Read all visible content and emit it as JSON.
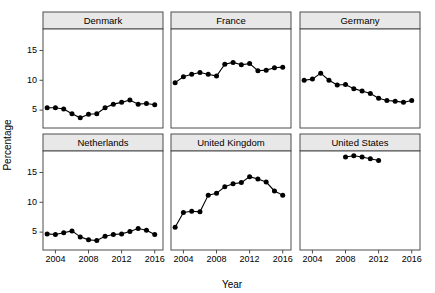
{
  "chart_data": {
    "type": "line",
    "title": "",
    "xlabel": "Year",
    "ylabel": "Percentage",
    "xlim": [
      2002.5,
      2017.0
    ],
    "ylim": [
      2.0,
      18.6
    ],
    "xticks": [
      2004,
      2008,
      2012,
      2016
    ],
    "yticks": [
      5,
      10,
      15
    ],
    "grid": false,
    "legend": "none",
    "facet_layout": {
      "rows": 2,
      "cols": 3
    },
    "marker": "filled-circle",
    "series_color": "#000000",
    "panels": [
      {
        "name": "Denmark",
        "row": 0,
        "col": 0,
        "x": [
          2003,
          2004,
          2005,
          2006,
          2007,
          2008,
          2009,
          2010,
          2011,
          2012,
          2013,
          2014,
          2015,
          2016
        ],
        "values": [
          5.4,
          5.4,
          5.2,
          4.4,
          3.7,
          4.3,
          4.4,
          5.4,
          6.0,
          6.3,
          6.7,
          6.0,
          6.1,
          5.9
        ]
      },
      {
        "name": "France",
        "row": 0,
        "col": 1,
        "x": [
          2003,
          2004,
          2005,
          2006,
          2007,
          2008,
          2009,
          2010,
          2011,
          2012,
          2013,
          2014,
          2015,
          2016
        ],
        "values": [
          9.6,
          10.6,
          11.0,
          11.3,
          11.0,
          10.7,
          12.7,
          13.0,
          12.6,
          12.8,
          11.6,
          11.7,
          12.1,
          12.2
        ]
      },
      {
        "name": "Germany",
        "row": 0,
        "col": 2,
        "x": [
          2003,
          2004,
          2005,
          2006,
          2007,
          2008,
          2009,
          2010,
          2011,
          2012,
          2013,
          2014,
          2015,
          2016
        ],
        "values": [
          10.0,
          10.2,
          11.2,
          10.0,
          9.2,
          9.3,
          8.6,
          8.2,
          7.8,
          7.0,
          6.6,
          6.5,
          6.3,
          6.6
        ]
      },
      {
        "name": "Netherlands",
        "row": 1,
        "col": 0,
        "x": [
          2003,
          2004,
          2005,
          2006,
          2007,
          2008,
          2009,
          2010,
          2011,
          2012,
          2013,
          2014,
          2015,
          2016
        ],
        "values": [
          4.7,
          4.6,
          4.9,
          5.2,
          4.2,
          3.7,
          3.6,
          4.3,
          4.6,
          4.7,
          5.1,
          5.6,
          5.3,
          4.6
        ]
      },
      {
        "name": "United Kingdom",
        "row": 1,
        "col": 1,
        "x": [
          2003,
          2004,
          2005,
          2006,
          2007,
          2008,
          2009,
          2010,
          2011,
          2012,
          2013,
          2014,
          2015,
          2016
        ],
        "values": [
          5.8,
          8.3,
          8.5,
          8.4,
          11.2,
          11.5,
          12.6,
          13.1,
          13.3,
          14.3,
          13.9,
          13.4,
          11.9,
          11.2
        ]
      },
      {
        "name": "United States",
        "row": 1,
        "col": 2,
        "x": [
          2008,
          2009,
          2010,
          2011,
          2012
        ],
        "values": [
          17.6,
          17.8,
          17.6,
          17.3,
          17.0
        ]
      }
    ]
  },
  "axis": {
    "y_title": "Percentage",
    "x_title": "Year"
  }
}
